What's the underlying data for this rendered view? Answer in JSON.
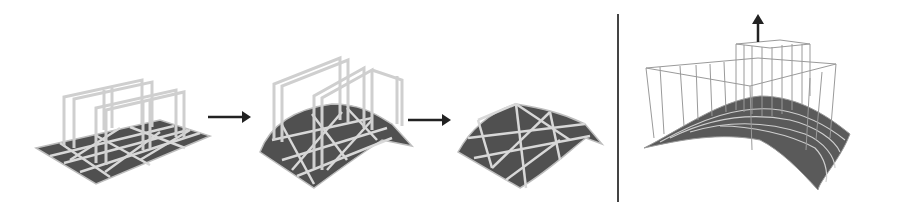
{
  "figure": {
    "panels": [
      {
        "id": "flat-mesh-with-handles",
        "description": "flat triangulated sheet with rectangular handle frames"
      },
      {
        "id": "deformed-mesh-with-handles",
        "description": "arched sheet with raised handle frames"
      },
      {
        "id": "deformed-mesh",
        "description": "arched triangulated sheet alone"
      },
      {
        "id": "lifted-surface-with-cage",
        "description": "smooth arched surface with wire cage lifted upward"
      }
    ],
    "arrows": [
      "arrow-1",
      "arrow-2",
      "up-arrow"
    ],
    "colors": {
      "mesh_fill": "#555555",
      "mesh_edge": "#d9d9d9",
      "frame": "#c8c8c8",
      "arrow": "#222222",
      "divider": "#444444",
      "background": "#ffffff"
    }
  }
}
